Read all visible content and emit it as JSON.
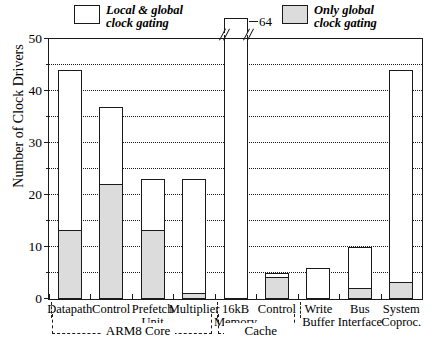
{
  "legend": {
    "items": [
      {
        "id": "local-global",
        "swatch": "white",
        "line1": "Local & global",
        "line2": "clock gating"
      },
      {
        "id": "only-global",
        "swatch": "gray",
        "line1": "Only global",
        "line2": "clock gating"
      }
    ]
  },
  "axis": {
    "ylabel": "Number of Clock Drivers",
    "yticks": [
      "0",
      "10",
      "20",
      "30",
      "40",
      "50"
    ],
    "yminor": [
      "5",
      "15",
      "25",
      "35",
      "45"
    ]
  },
  "groups": [
    {
      "id": "arm8-core",
      "label": "ARM8 Core"
    },
    {
      "id": "cache",
      "label": "Cache"
    }
  ],
  "overflow": {
    "value_label": "64"
  },
  "caption": "",
  "chart_data": {
    "type": "bar",
    "title": "",
    "xlabel": "",
    "ylabel": "Number of Clock Drivers",
    "ylim": [
      0,
      50
    ],
    "grid": true,
    "legend_position": "top",
    "note": "16kB Memory bar is broken; its true total is 64",
    "categories": [
      "Datapath",
      "Control",
      "Prefetch Unit",
      "Multiplier",
      "16kB Memory",
      "Control",
      "Write Buffer",
      "Bus Interface",
      "System Coproc."
    ],
    "category_lines": [
      [
        "Datapath"
      ],
      [
        "Control"
      ],
      [
        "Prefetch",
        "Unit"
      ],
      [
        "Multiplier"
      ],
      [
        "16kB",
        "Memory"
      ],
      [
        "Control"
      ],
      [
        "Write",
        "Buffer"
      ],
      [
        "Bus",
        "Interface"
      ],
      [
        "System",
        "Coproc."
      ]
    ],
    "groups": [
      {
        "label": "ARM8 Core",
        "categories": [
          "Datapath",
          "Control",
          "Prefetch Unit",
          "Multiplier"
        ]
      },
      {
        "label": "Cache",
        "categories": [
          "16kB Memory",
          "Control"
        ]
      }
    ],
    "series": [
      {
        "name": "Local & global clock gating",
        "color": "#ffffff",
        "values": [
          44,
          37,
          23,
          23,
          64,
          5,
          6,
          10,
          44
        ]
      },
      {
        "name": "Only global clock gating",
        "color": "#dcdcdc",
        "values": [
          13,
          22,
          13,
          1,
          0,
          4,
          0,
          2,
          3
        ]
      }
    ],
    "annotations": [
      {
        "text": "64",
        "category": "16kB Memory",
        "kind": "axis-break-value"
      }
    ]
  }
}
